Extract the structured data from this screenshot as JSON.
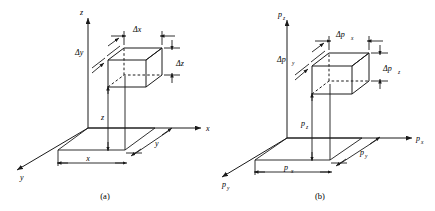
{
  "figure": {
    "type": "technical-diagram",
    "stroke_color": "#1a1a1a",
    "background_color": "#ffffff"
  },
  "panels": [
    {
      "id": "a",
      "caption": "(a)",
      "space": "position",
      "axes": [
        {
          "name": "vertical-axis",
          "label": "z",
          "direction": "up"
        },
        {
          "name": "right-axis",
          "label": "x",
          "direction": "right"
        },
        {
          "name": "depth-axis",
          "label": "y",
          "direction": "lower-left"
        }
      ],
      "cell_dimensions": [
        {
          "name": "delta-x",
          "label": "Δx",
          "position": "top"
        },
        {
          "name": "delta-y",
          "label": "Δy",
          "position": "upper-left"
        },
        {
          "name": "delta-z",
          "label": "Δz",
          "position": "right"
        }
      ],
      "position_dimensions": [
        {
          "name": "z-extent",
          "label": "z",
          "orientation": "vertical"
        },
        {
          "name": "x-extent",
          "label": "x",
          "orientation": "horizontal"
        },
        {
          "name": "y-extent",
          "label": "y",
          "orientation": "diagonal"
        }
      ]
    },
    {
      "id": "b",
      "caption": "(b)",
      "space": "momentum",
      "axes": [
        {
          "name": "vertical-axis",
          "label": "p",
          "sub": "z",
          "direction": "up"
        },
        {
          "name": "right-axis",
          "label": "p",
          "sub": "x",
          "direction": "right"
        },
        {
          "name": "depth-axis",
          "label": "p",
          "sub": "y",
          "direction": "lower-left"
        }
      ],
      "cell_dimensions": [
        {
          "name": "delta-px",
          "label": "Δp",
          "sub": "x",
          "position": "top"
        },
        {
          "name": "delta-py",
          "label": "Δp",
          "sub": "y",
          "position": "upper-left"
        },
        {
          "name": "delta-pz",
          "label": "Δp",
          "sub": "z",
          "position": "right"
        }
      ],
      "position_dimensions": [
        {
          "name": "pz-extent",
          "label": "p",
          "sub": "z",
          "orientation": "vertical"
        },
        {
          "name": "px-extent",
          "label": "p",
          "sub": "x",
          "orientation": "horizontal"
        },
        {
          "name": "py-extent",
          "label": "p",
          "sub": "y",
          "orientation": "diagonal"
        }
      ]
    }
  ]
}
